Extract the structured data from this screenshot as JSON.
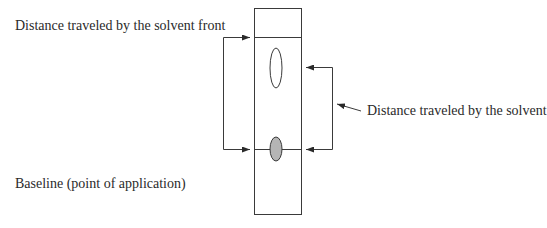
{
  "diagram": {
    "type": "thin-layer-chromatography-plate",
    "labels": {
      "solvent_front": "Distance traveled by the solvent front",
      "solvent": "Distance traveled by the solvent",
      "baseline": "Baseline (point of application)"
    },
    "colors": {
      "line": "#3a3a3a",
      "applied_spot_fill": "#b5b5b5",
      "migrated_spot_fill": "#ffffff",
      "background": "#ffffff"
    }
  }
}
